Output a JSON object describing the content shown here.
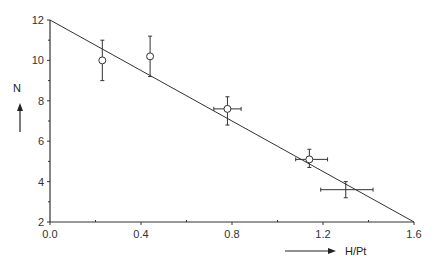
{
  "chart_data": {
    "type": "scatter",
    "title": "",
    "xlabel": "H/Pt",
    "ylabel": "N",
    "xlim": [
      0.0,
      1.6
    ],
    "ylim": [
      2,
      12
    ],
    "x_ticks": [
      "0.0",
      "0.4",
      "0.8",
      "1.2",
      "1.6"
    ],
    "y_ticks": [
      "2",
      "4",
      "6",
      "8",
      "10",
      "12"
    ],
    "grid": false,
    "legend": null,
    "series": [
      {
        "name": "data",
        "marker": "open-circle",
        "points": [
          {
            "x": 0.23,
            "y": 10.0,
            "yerr": [
              9.0,
              11.0
            ]
          },
          {
            "x": 0.44,
            "y": 10.2,
            "yerr": [
              9.2,
              11.2
            ]
          },
          {
            "x": 0.78,
            "y": 7.6,
            "xerr": [
              0.72,
              0.84
            ],
            "yerr": [
              6.8,
              8.2
            ]
          },
          {
            "x": 1.14,
            "y": 5.1,
            "xerr": [
              1.08,
              1.22
            ],
            "yerr": [
              4.7,
              5.6
            ]
          },
          {
            "x": 1.3,
            "y": 3.6,
            "xerr": [
              1.19,
              1.42
            ],
            "yerr": [
              3.2,
              4.0
            ],
            "marker": "none"
          }
        ]
      },
      {
        "name": "fit",
        "type": "line",
        "points": [
          {
            "x": 0.0,
            "y": 12.0
          },
          {
            "x": 1.6,
            "y": 2.0
          }
        ]
      }
    ],
    "annotations": [
      "arrow pointing up next to N",
      "arrow pointing right before H/Pt"
    ]
  },
  "axes": {
    "x_label": "H/Pt",
    "y_label": "N",
    "x_ticks": [
      "0.0",
      "0.4",
      "0.8",
      "1.2",
      "1.6"
    ],
    "y_ticks": [
      "2",
      "4",
      "6",
      "8",
      "10",
      "12"
    ]
  }
}
